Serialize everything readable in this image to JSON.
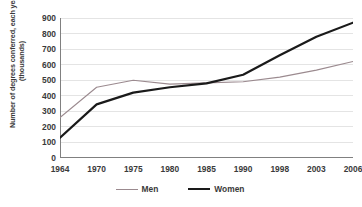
{
  "chart_data": {
    "type": "line",
    "title": "",
    "xlabel": "",
    "ylabel": "Number of degrees conferred, each year (thousands)",
    "categories": [
      "1964",
      "1970",
      "1975",
      "1980",
      "1985",
      "1990",
      "1998",
      "2003",
      "2006"
    ],
    "series": [
      {
        "name": "Men",
        "color": "#9b8a8f",
        "width": 1.1,
        "values": [
          260,
          455,
          500,
          475,
          483,
          490,
          520,
          565,
          620
        ]
      },
      {
        "name": "Women",
        "color": "#1a1a1a",
        "width": 2.2,
        "values": [
          130,
          345,
          420,
          455,
          480,
          535,
          660,
          780,
          870
        ]
      }
    ],
    "ylim": [
      0,
      900
    ],
    "ytick_step": 100,
    "yticks": [
      "900",
      "800",
      "700",
      "600",
      "500",
      "400",
      "300",
      "200",
      "100",
      "0"
    ],
    "grid": true,
    "grid_color": "#d9d9d9",
    "axis_color": "#808080",
    "legend_position": "bottom"
  },
  "legend": {
    "items": [
      {
        "label": "Men"
      },
      {
        "label": "Women"
      }
    ]
  }
}
